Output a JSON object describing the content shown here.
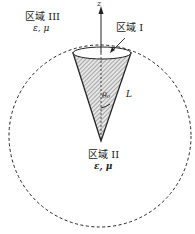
{
  "diagram": {
    "region3": {
      "name": "区域 III",
      "params": "ε, μ"
    },
    "region1": {
      "name": "区域 I"
    },
    "region2": {
      "name": "区域 II",
      "params": "ε, μ"
    },
    "axis_label": "z",
    "angle_label": "θ₀",
    "length_label": "L",
    "colors": {
      "stroke": "#222222",
      "fill": "#cfcfcf"
    }
  }
}
